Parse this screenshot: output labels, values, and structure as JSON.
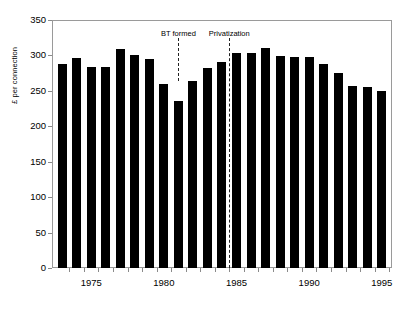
{
  "chart_data": {
    "type": "bar",
    "title": "",
    "xlabel": "",
    "ylabel": "£ per connection",
    "ylim": [
      0,
      350
    ],
    "xlim": [
      1972.3,
      1995.7
    ],
    "grid": false,
    "legend": null,
    "bar_color": "#000000",
    "categories": [
      "1973",
      "1974",
      "1975",
      "1976",
      "1977",
      "1978",
      "1979",
      "1980",
      "1981",
      "1982",
      "1983",
      "1984",
      "1985",
      "1986",
      "1987",
      "1988",
      "1989",
      "1990",
      "1991",
      "1992",
      "1993",
      "1994",
      "1995"
    ],
    "values": [
      288,
      296,
      283,
      283,
      309,
      301,
      295,
      260,
      235,
      264,
      282,
      291,
      303,
      303,
      310,
      299,
      298,
      298,
      288,
      275,
      257,
      256,
      250
    ],
    "ytick_labels": [
      "0",
      "50",
      "100",
      "150",
      "200",
      "250",
      "300",
      "350"
    ],
    "ytick_values": [
      0,
      50,
      100,
      150,
      200,
      250,
      300,
      350
    ],
    "xtick_labels": [
      "1975",
      "1980",
      "1985",
      "1990",
      "1995"
    ],
    "xtick_values": [
      1975,
      1980,
      1985,
      1990,
      1995
    ],
    "annotations": [
      {
        "label": "BT formed",
        "x": 1981,
        "label_y": 330,
        "line_top": 325,
        "line_bottom": 264
      },
      {
        "label": "Privatization",
        "x": 1984.5,
        "label_y": 330,
        "line_top": 325,
        "line_bottom": 0
      }
    ]
  }
}
